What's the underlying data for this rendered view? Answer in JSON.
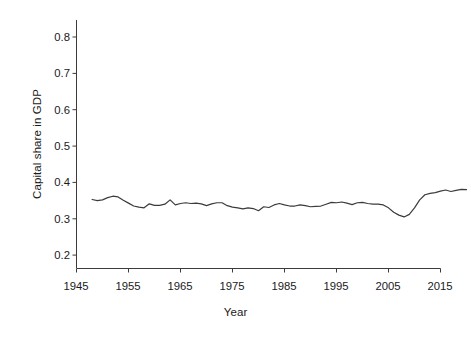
{
  "chart_data": {
    "type": "line",
    "title": "",
    "xlabel": "Year",
    "ylabel": "Capital share in GDP",
    "xlim": [
      1945,
      2015
    ],
    "ylim": [
      0.155,
      0.845
    ],
    "grid": false,
    "legend": null,
    "xticks": [
      1945,
      1955,
      1965,
      1975,
      1985,
      1995,
      2005,
      2015
    ],
    "xtick_labels": [
      "1945",
      "1955",
      "1965",
      "1975",
      "1985",
      "1995",
      "2005",
      "2015"
    ],
    "yticks": [
      0.2,
      0.3,
      0.4,
      0.5,
      0.6,
      0.7,
      0.8
    ],
    "ytick_labels": [
      "0.2",
      "0.3",
      "0.4",
      "0.5",
      "0.6",
      "0.7",
      "0.8"
    ],
    "line_color": "#3b3b3b",
    "line_width": 1.2,
    "series": [
      {
        "name": "Capital share in GDP",
        "x": [
          1948,
          1949,
          1950,
          1951,
          1952,
          1953,
          1954,
          1955,
          1956,
          1957,
          1958,
          1959,
          1960,
          1961,
          1962,
          1963,
          1964,
          1965,
          1966,
          1967,
          1968,
          1969,
          1970,
          1971,
          1972,
          1973,
          1974,
          1975,
          1976,
          1977,
          1978,
          1979,
          1980,
          1981,
          1982,
          1983,
          1984,
          1985,
          1986,
          1987,
          1988,
          1989,
          1990,
          1991,
          1992,
          1993,
          1994,
          1995,
          1996,
          1997,
          1998,
          1999,
          2000,
          2001,
          2002,
          2003,
          2004,
          2005,
          2006,
          2007,
          2008,
          2009,
          2010,
          2011,
          2012,
          2013
        ],
        "y": [
          0.353,
          0.35,
          0.352,
          0.358,
          0.362,
          0.36,
          0.351,
          0.343,
          0.335,
          0.332,
          0.33,
          0.341,
          0.337,
          0.337,
          0.34,
          0.352,
          0.338,
          0.342,
          0.344,
          0.342,
          0.343,
          0.341,
          0.336,
          0.341,
          0.344,
          0.344,
          0.336,
          0.332,
          0.33,
          0.327,
          0.33,
          0.328,
          0.322,
          0.333,
          0.331,
          0.338,
          0.342,
          0.338,
          0.335,
          0.335,
          0.338,
          0.336,
          0.333,
          0.334,
          0.335,
          0.34,
          0.345,
          0.344,
          0.346,
          0.343,
          0.339,
          0.344,
          0.345,
          0.342,
          0.34,
          0.34,
          0.338,
          0.33,
          0.318,
          0.31,
          0.305,
          0.312,
          0.33,
          0.352,
          0.366,
          0.37
        ],
        "y_segment_2": [
          0.372,
          0.376,
          0.379,
          0.375,
          0.378,
          0.381,
          0.38
        ]
      }
    ]
  },
  "axis": {
    "axis_color": "#3b3b3b",
    "tick_length": 4
  }
}
